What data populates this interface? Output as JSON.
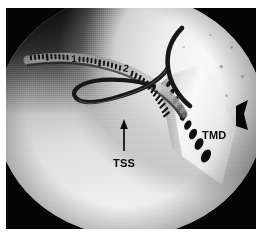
{
  "figure": {
    "kind": "arthroscopic-photograph",
    "modality": "arthroscopy",
    "frame": {
      "border_color": "#ffffff",
      "frame_color": "#050505",
      "field_shape": "circle"
    }
  },
  "annotations": [
    {
      "id": "tss",
      "label": "TSS",
      "meaning": "suture shuttle loop",
      "marker": "arrow",
      "arrow_direction": "up",
      "color": "#0a0a0a"
    },
    {
      "id": "tmd",
      "label": "TMD",
      "meaning": "meniscal repair device",
      "marker": "none",
      "color": "#0a0a0a"
    }
  ],
  "instruments": {
    "probe": {
      "name": "graduated-measuring-probe",
      "graduation_labels": [
        "1",
        "2"
      ],
      "tick_count": 34,
      "color": "#141414"
    },
    "suture_loop": {
      "name": "suture-shuttle-loop",
      "color": "#161616"
    },
    "device": {
      "name": "meniscal-repair-device",
      "dot_count": 9,
      "color": "#101010"
    }
  },
  "palette": {
    "page_background": "#ffffff",
    "frame_background": "#050505",
    "tissue_bright": "#f4f4f4",
    "tissue_mid": "#b8b8b8",
    "tissue_shadow": "#121212",
    "annotation": "#0a0a0a"
  }
}
